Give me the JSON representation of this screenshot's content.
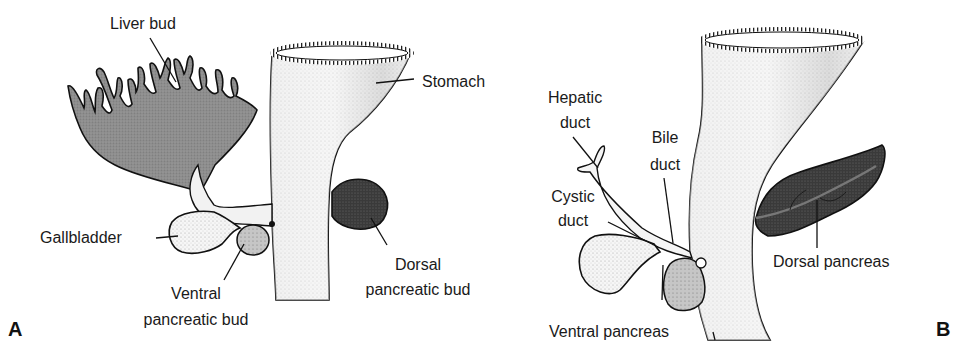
{
  "figure": {
    "panels": [
      {
        "letter": "A",
        "labels": {
          "liver_bud": "Liver bud",
          "stomach": "Stomach",
          "gallbladder": "Gallbladder",
          "ventral_1": "Ventral",
          "ventral_2": "pancreatic bud",
          "dorsal_1": "Dorsal",
          "dorsal_2": "pancreatic bud"
        }
      },
      {
        "letter": "B",
        "labels": {
          "hepatic_1": "Hepatic",
          "hepatic_2": "duct",
          "bile_1": "Bile",
          "bile_2": "duct",
          "cystic_1": "Cystic",
          "cystic_2": "duct",
          "dorsal_pancreas": "Dorsal pancreas",
          "ventral_pancreas": "Ventral pancreas"
        }
      }
    ],
    "colors": {
      "outline": "#111111",
      "liver_fill": "#8a8a8a",
      "dorsal_bud_fill": "#2e2e2e",
      "ventral_bud_fill": "#b8b8b8",
      "gut_fill": "#f4f4f4",
      "gut_shade": "#c8c8c8"
    }
  }
}
